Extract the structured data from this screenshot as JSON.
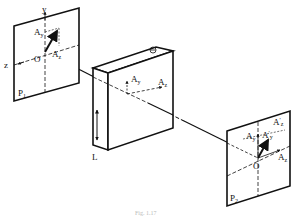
{
  "diagram": {
    "caption": "Fig. 1.17",
    "panel_left": {
      "name": "P",
      "subscript": "1",
      "origin_label": "O",
      "axis_y_label": "y",
      "axis_z_label": "z",
      "component_y": {
        "base": "A",
        "sub": "y"
      },
      "component_z": {
        "base": "A",
        "sub": "z"
      }
    },
    "block": {
      "length_label": "L",
      "symbol": "⊖",
      "component_y": {
        "base": "A",
        "sub": "y"
      },
      "component_z": {
        "base": "A",
        "sub": "z"
      }
    },
    "panel_right": {
      "name": "P",
      "subscript": "2",
      "origin_label": "O",
      "component_y": {
        "base": "A",
        "sub": "y"
      },
      "component_z": {
        "base": "A",
        "sub": "z"
      },
      "component_y_prime": {
        "base": "A",
        "sub": "y",
        "prime": "′"
      },
      "component_z_prime": {
        "base": "A",
        "sub": "z",
        "prime": "′"
      }
    }
  }
}
